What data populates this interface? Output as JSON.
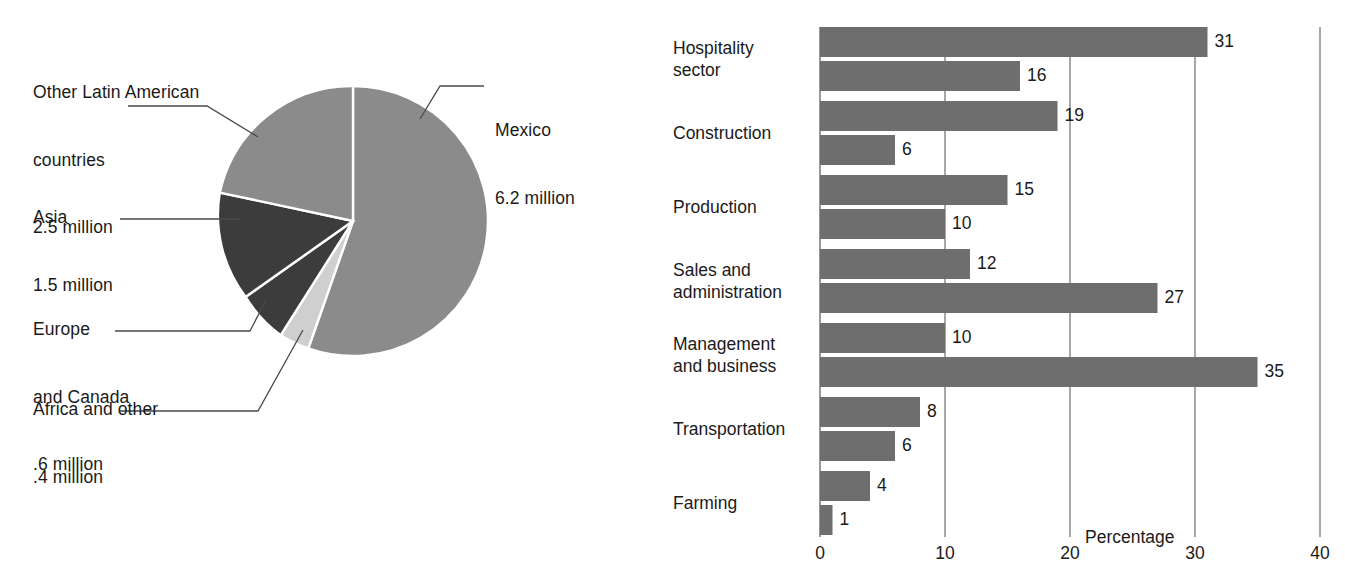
{
  "chart_data": [
    {
      "type": "pie",
      "title": "",
      "unit": "million",
      "total": 11.2,
      "legend": "labels-with-leader-lines",
      "categories": [
        "Mexico",
        "Other Latin American countries",
        "Asia",
        "Europe and Canada",
        "Africa and other"
      ],
      "values": [
        6.2,
        2.5,
        1.5,
        0.6,
        0.4
      ],
      "labels": [
        {
          "name": "Mexico",
          "line1": "Mexico",
          "line2": "6.2 million",
          "value": 6.2,
          "color": "#8b8b8b"
        },
        {
          "name": "Other Latin American countries",
          "line1": "Other Latin American",
          "line2": "countries",
          "line3": "2.5 million",
          "value": 2.5,
          "color": "#8b8b8b"
        },
        {
          "name": "Asia",
          "line1": "Asia",
          "line2": "1.5 million",
          "value": 1.5,
          "color": "#3c3c3c"
        },
        {
          "name": "Europe and Canada",
          "line1": "Europe",
          "line2": "and Canada",
          "line3": ".6 million",
          "value": 0.6,
          "color": "#3c3c3c"
        },
        {
          "name": "Africa and other",
          "line1": "Africa and other",
          "line2": ".4 million",
          "value": 0.4,
          "color": "#cfcfcf"
        }
      ]
    },
    {
      "type": "bar",
      "orientation": "horizontal",
      "title": "",
      "xlabel": "Percentage",
      "ylabel": "",
      "xlim": [
        0,
        40
      ],
      "xticks": [
        "0",
        "10",
        "20",
        "30",
        "40"
      ],
      "xtick_values": [
        0,
        10,
        20,
        30,
        40
      ],
      "grid": "vertical",
      "categories": [
        "Hospitality sector",
        "Construction",
        "Production",
        "Sales and administration",
        "Management and business",
        "Transportation",
        "Farming"
      ],
      "category_lines": [
        [
          "Hospitality",
          "sector"
        ],
        [
          "Construction"
        ],
        [
          "Production"
        ],
        [
          "Sales and",
          "administration"
        ],
        [
          "Management",
          "and business"
        ],
        [
          "Transportation"
        ],
        [
          "Farming"
        ]
      ],
      "series": [
        {
          "name": "series-1",
          "color": "#6e6e6e",
          "values": [
            31,
            19,
            15,
            12,
            10,
            8,
            4
          ]
        },
        {
          "name": "series-2",
          "color": "#6e6e6e",
          "values": [
            16,
            6,
            10,
            27,
            35,
            6,
            1
          ]
        }
      ],
      "bar_value_labels": [
        "31",
        "16",
        "19",
        "6",
        "15",
        "10",
        "12",
        "27",
        "10",
        "35",
        "8",
        "6",
        "4",
        "1"
      ]
    }
  ],
  "colors": {
    "slice_medium_gray": "#8b8b8b",
    "slice_dark_gray": "#3c3c3c",
    "slice_light_gray": "#cfcfcf",
    "bar_gray": "#6e6e6e",
    "axis": "#6d6d6d",
    "text": "#1a1a1a",
    "leader_line": "#4a4a4a",
    "background": "#ffffff"
  }
}
